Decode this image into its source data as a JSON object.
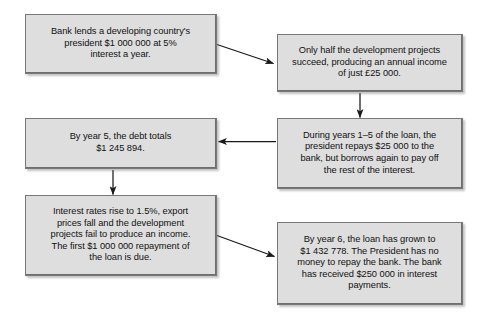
{
  "diagram": {
    "background_color": "#ffffff",
    "node_fill_color": "#dedede",
    "node_border_color": "#787878",
    "text_color": "#111111",
    "arrow_color": "#1a1a1a",
    "nodes": [
      {
        "id": "bank-loan",
        "name": "bank-lends-box",
        "text": "Bank lends a developing country's\npresident $1 000 000 at 5%\ninterest a year."
      },
      {
        "id": "half-projects",
        "name": "projects-succeed-box",
        "text": "Only half the development projects\nsucceed, producing an annual income\nof just £25 000."
      },
      {
        "id": "years-1-5",
        "name": "repayment-years-box",
        "text": "During years 1–5 of the loan, the\npresident repays $25 000 to the\nbank, but borrows again to pay off\nthe rest of the interest."
      },
      {
        "id": "year-5-debt",
        "name": "year-5-debt-box",
        "text": "By year 5, the debt totals\n$1 245 894."
      },
      {
        "id": "rates-rise",
        "name": "interest-rates-rise-box",
        "text": "Interest rates rise to 1.5%, export\nprices fall and the development\nprojects fail to produce an income.\nThe first $1 000 000 repayment of\nthe loan is due."
      },
      {
        "id": "year-6-loan",
        "name": "year-6-loan-box",
        "text": "By year 6, the loan has grown to\n$1 432 778. The President has no\nmoney to repay the bank. The bank\nhas received $250 000 in interest\npayments."
      }
    ],
    "connectors": [
      {
        "id": "c1",
        "from": "bank-loan",
        "to": "half-projects",
        "style": "diagonal-down-right"
      },
      {
        "id": "c2",
        "from": "half-projects",
        "to": "years-1-5",
        "style": "vertical-down"
      },
      {
        "id": "c3",
        "from": "years-1-5",
        "to": "year-5-debt",
        "style": "horizontal-left"
      },
      {
        "id": "c4",
        "from": "year-5-debt",
        "to": "rates-rise",
        "style": "vertical-down"
      },
      {
        "id": "c5",
        "from": "rates-rise",
        "to": "year-6-loan",
        "style": "diagonal-down-right"
      }
    ]
  }
}
